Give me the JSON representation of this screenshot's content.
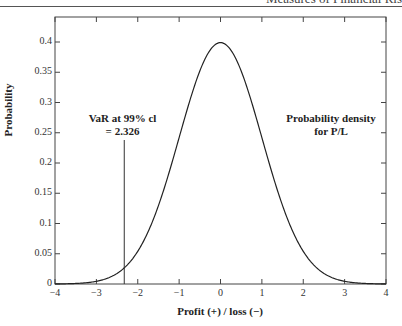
{
  "header": {
    "running_head": "Measures of Financial Ris"
  },
  "chart_data": {
    "type": "line",
    "title": "",
    "xlabel": "Profit (+) / loss (−)",
    "ylabel": "Probability",
    "xlim": [
      -4,
      4
    ],
    "ylim": [
      0,
      0.42
    ],
    "xticks": [
      -4,
      -3,
      -2,
      -1,
      0,
      1,
      2,
      3,
      4
    ],
    "xtick_labels": [
      "−4",
      "−3",
      "−2",
      "−1",
      "0",
      "1",
      "2",
      "3",
      "4"
    ],
    "yticks": [
      0,
      0.05,
      0.1,
      0.15,
      0.2,
      0.25,
      0.3,
      0.35,
      0.4
    ],
    "ytick_labels": [
      "0",
      "0.05",
      "0.1",
      "0.15",
      "0.2",
      "0.25",
      "0.3",
      "0.35",
      "0.4"
    ],
    "grid": false,
    "series": [
      {
        "name": "Probability density for P/L",
        "distribution": "standard normal",
        "x": [
          -4,
          -3.5,
          -3,
          -2.5,
          -2,
          -1.5,
          -1,
          -0.5,
          0,
          0.5,
          1,
          1.5,
          2,
          2.5,
          3,
          3.5,
          4
        ],
        "values": [
          0.0001,
          0.0009,
          0.0044,
          0.0175,
          0.054,
          0.1295,
          0.242,
          0.3521,
          0.3989,
          0.3521,
          0.242,
          0.1295,
          0.054,
          0.0175,
          0.0044,
          0.0009,
          0.0001
        ]
      }
    ],
    "annotations": [
      {
        "text_line1": "VaR at 99% cl",
        "text_line2": "= 2.326",
        "x": -2.326,
        "type": "vertical-line"
      },
      {
        "text_line1": "Probability density",
        "text_line2": "for P/L"
      }
    ]
  }
}
